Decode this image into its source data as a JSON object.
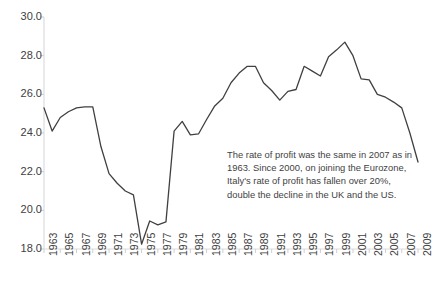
{
  "chart_data": {
    "type": "line",
    "title": "",
    "xlabel": "",
    "ylabel": "",
    "ylim": [
      18.0,
      30.0
    ],
    "xlim": [
      1963,
      2009
    ],
    "grid": false,
    "legend": null,
    "yticks": [
      "30.0",
      "28.0",
      "26.0",
      "24.0",
      "22.0",
      "20.0",
      "18.0"
    ],
    "ytick_values": [
      30.0,
      28.0,
      26.0,
      24.0,
      22.0,
      20.0,
      18.0
    ],
    "xticks": [
      "1963",
      "1965",
      "1967",
      "1969",
      "1971",
      "1973",
      "1975",
      "1977",
      "1979",
      "1981",
      "1983",
      "1985",
      "1987",
      "1989",
      "1991",
      "1993",
      "1995",
      "1997",
      "1999",
      "2001",
      "2003",
      "2005",
      "2007",
      "2009"
    ],
    "xtick_values": [
      1963,
      1965,
      1967,
      1969,
      1971,
      1973,
      1975,
      1977,
      1979,
      1981,
      1983,
      1985,
      1987,
      1989,
      1991,
      1993,
      1995,
      1997,
      1999,
      2001,
      2003,
      2005,
      2007,
      2009
    ],
    "series": [
      {
        "name": "Italy rate of profit",
        "color": "#404040",
        "x": [
          1963,
          1964,
          1965,
          1966,
          1967,
          1968,
          1969,
          1970,
          1971,
          1972,
          1973,
          1974,
          1975,
          1976,
          1977,
          1978,
          1979,
          1980,
          1981,
          1982,
          1983,
          1984,
          1985,
          1986,
          1987,
          1988,
          1989,
          1990,
          1991,
          1992,
          1993,
          1994,
          1995,
          1996,
          1997,
          1998,
          1999,
          2000,
          2001,
          2002,
          2003,
          2004,
          2005,
          2006,
          2007,
          2008,
          2009
        ],
        "values": [
          25.3,
          24.1,
          24.8,
          25.1,
          25.3,
          25.35,
          25.35,
          23.3,
          21.9,
          21.4,
          21.0,
          20.8,
          18.25,
          19.45,
          19.25,
          19.4,
          24.1,
          24.6,
          23.9,
          23.95,
          24.7,
          25.4,
          25.8,
          26.6,
          27.1,
          27.45,
          27.45,
          26.6,
          26.2,
          25.7,
          26.15,
          26.25,
          27.45,
          27.2,
          26.95,
          27.95,
          28.3,
          28.7,
          28.0,
          26.8,
          26.75,
          26.0,
          25.85,
          25.6,
          25.3,
          24.0,
          22.5
        ]
      }
    ]
  },
  "annotation": {
    "text": "The rate of profit was the same in 2007 as in 1963. Since 2000, on joining  the Eurozone, Italy's rate of profit has fallen over 20%, double the decline in the UK and the US."
  },
  "axis": {
    "axis_color": "#d9d9d9",
    "tick_color": "#bfbfbf",
    "label_color": "#404040"
  }
}
